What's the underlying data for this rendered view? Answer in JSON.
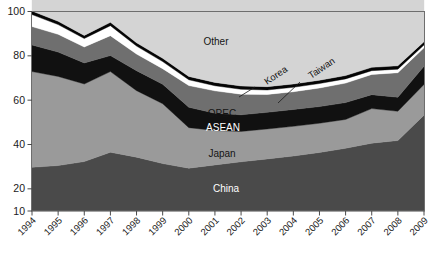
{
  "chart_data": {
    "type": "area",
    "title": "",
    "subtitle": "",
    "xlabel": "",
    "ylabel": "",
    "stacked": true,
    "grid": false,
    "legend_position": "inline-labels",
    "categories": [
      "1994",
      "1995",
      "1996",
      "1997",
      "1998",
      "1999",
      "2000",
      "2001",
      "2002",
      "2003",
      "2004",
      "2005",
      "2006",
      "2007",
      "2008",
      "2009"
    ],
    "x": [
      1994,
      1995,
      1996,
      1997,
      1998,
      1999,
      2000,
      2001,
      2002,
      2003,
      2004,
      2005,
      2006,
      2007,
      2008,
      2009
    ],
    "xlim": [
      1994,
      2009
    ],
    "ylim": [
      10,
      100
    ],
    "yticks": [
      10,
      20,
      40,
      60,
      80,
      100
    ],
    "ytick_labels": [
      "10",
      "20",
      "40",
      "60",
      "80",
      "100"
    ],
    "series": [
      {
        "name": "China",
        "color": "#4a4a4a",
        "label_color": "#ffffff",
        "values": [
          19.7,
          20.5,
          22.3,
          26.5,
          24.3,
          21.4,
          19.3,
          20.8,
          22.2,
          23.5,
          24.8,
          26.4,
          28.3,
          30.6,
          31.8,
          43.2
        ]
      },
      {
        "name": "Japan",
        "color": "#9a9a9a",
        "label_color": "#141414",
        "values": [
          43.2,
          40.2,
          35.0,
          36.4,
          30.0,
          27.0,
          18.3,
          15.5,
          13.7,
          13.5,
          13.4,
          13.2,
          13.0,
          15.6,
          13.2,
          13.9
        ]
      },
      {
        "name": "ASEAN",
        "color": "#111111",
        "label_color": "#ffffff",
        "values": [
          12.0,
          11.0,
          9.5,
          7.2,
          9.0,
          8.8,
          9.2,
          7.8,
          7.5,
          7.5,
          7.6,
          7.5,
          7.6,
          6.3,
          6.3,
          8.2
        ]
      },
      {
        "name": "OPEC",
        "color": "#6f6f6f",
        "label_color": "#141414",
        "values": [
          8.3,
          8.0,
          7.2,
          9.0,
          7.5,
          7.0,
          9.8,
          10.1,
          9.3,
          8.1,
          8.0,
          8.4,
          8.8,
          9.1,
          11.1,
          8.3
        ]
      },
      {
        "name": "Taiwan",
        "color": "#ffffff",
        "label_color": "#141414",
        "values": [
          5.4,
          4.4,
          3.8,
          4.5,
          3.6,
          3.2,
          2.6,
          2.3,
          2.2,
          2.0,
          2.0,
          2.0,
          1.9,
          1.7,
          1.6,
          1.3
        ]
      },
      {
        "name": "Korea",
        "color": "#050505",
        "label_color": "#141414",
        "values": [
          1.6,
          1.5,
          1.4,
          1.5,
          1.5,
          1.5,
          1.5,
          1.5,
          1.5,
          1.5,
          1.5,
          1.5,
          1.5,
          1.5,
          1.5,
          1.5
        ]
      },
      {
        "name": "Other",
        "color": "#d4d4d4",
        "label_color": "#141414",
        "values": [
          9.8,
          14.4,
          20.8,
          14.9,
          24.1,
          31.1,
          39.3,
          42.0,
          43.6,
          43.9,
          42.7,
          41.0,
          38.9,
          35.2,
          34.5,
          23.6
        ]
      }
    ],
    "series_labels": [
      {
        "name": "Other",
        "text": "Other",
        "x": 216,
        "y": 45,
        "anchor": "middle",
        "style": "dark"
      },
      {
        "name": "OPEC",
        "text": "OPEC",
        "x": 222,
        "y": 117,
        "anchor": "middle",
        "style": "dark"
      },
      {
        "name": "ASEAN",
        "text": "ASEAN",
        "x": 223,
        "y": 131,
        "anchor": "middle",
        "style": "light"
      },
      {
        "name": "Japan",
        "text": "Japan",
        "x": 222,
        "y": 157,
        "anchor": "middle",
        "style": "dark"
      },
      {
        "name": "China",
        "text": "China",
        "x": 226,
        "y": 192,
        "anchor": "middle",
        "style": "light"
      }
    ],
    "callouts": [
      {
        "name": "Korea",
        "text": "Korea",
        "tx": 267,
        "ty": 85,
        "rotate": -34,
        "lx1": 255,
        "ly1": 87,
        "lx2": 239,
        "ly2": 97
      },
      {
        "name": "Taiwan",
        "text": "Taiwan",
        "tx": 311,
        "ty": 79,
        "rotate": -34,
        "lx1": 300,
        "ly1": 82,
        "lx2": 278,
        "ly2": 103
      }
    ]
  }
}
